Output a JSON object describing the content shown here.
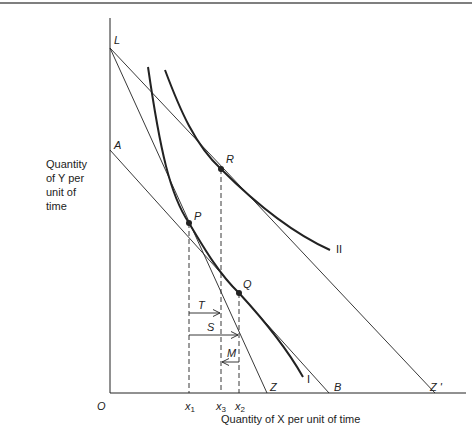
{
  "diagram": {
    "y_axis_title": [
      "Quantity",
      "of Y per",
      "unit of",
      "time"
    ],
    "x_axis_title": "Quantity of X per unit of time",
    "origin_label": "O",
    "points": {
      "L": "L",
      "A": "A",
      "R": "R",
      "P": "P",
      "Q": "Q",
      "Z": "Z",
      "B": "B",
      "Zprime": "Z '"
    },
    "curves": {
      "I": "I",
      "II": "II"
    },
    "x_ticks": {
      "x1": "x",
      "x1_sub": "1",
      "x3": "x",
      "x3_sub": "3",
      "x2": "x",
      "x2_sub": "2"
    },
    "effects": {
      "T": "T",
      "S": "S",
      "M": "M"
    },
    "colors": {
      "line": "#222222",
      "text": "#222222"
    }
  }
}
